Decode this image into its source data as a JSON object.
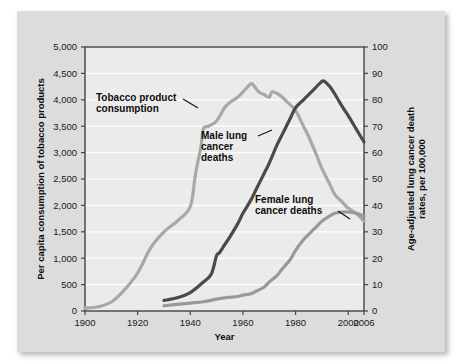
{
  "figure": {
    "background_color": "#dcdcdc",
    "plot_background_color": "#ebebeb",
    "gridline_color": "#ffffff",
    "axis_color": "#444444"
  },
  "chart_data": {
    "type": "line",
    "title": "",
    "xlabel": "Year",
    "ylabel": "Per capita consumption of tobacco products",
    "y2label_line1": "Age-adjusted lung cancer death",
    "y2label_line2": "rates, per 100,000",
    "grid": true,
    "legend_position": "inline-annotations",
    "xlim": [
      1900,
      2006
    ],
    "xticks": [
      1900,
      1920,
      1940,
      1960,
      1980,
      2000,
      2006
    ],
    "xtick_labels": [
      "1900",
      "1920",
      "1940",
      "1960",
      "1980",
      "2000",
      "2006"
    ],
    "ylim": [
      0,
      5000
    ],
    "yticks": [
      0,
      500,
      1000,
      1500,
      2000,
      2500,
      3000,
      3500,
      4000,
      4500,
      5000
    ],
    "ytick_labels": [
      "0",
      "500",
      "1,000",
      "1,500",
      "2,000",
      "2,500",
      "3,000",
      "3,500",
      "4,000",
      "4,500",
      "5,000"
    ],
    "y2lim": [
      0,
      100
    ],
    "y2ticks": [
      0,
      10,
      20,
      30,
      40,
      50,
      60,
      70,
      80,
      90,
      100
    ],
    "y2tick_labels": [
      "0",
      "10",
      "20",
      "30",
      "40",
      "50",
      "60",
      "70",
      "80",
      "90",
      "100"
    ],
    "series": [
      {
        "name": "Tobacco product consumption",
        "axis": "left",
        "color": "#a8a8a8",
        "line_width": 3.2,
        "x": [
          1900,
          1905,
          1910,
          1915,
          1920,
          1925,
          1930,
          1935,
          1940,
          1942,
          1944,
          1945,
          1947,
          1950,
          1953,
          1955,
          1958,
          1960,
          1963,
          1964,
          1966,
          1968,
          1970,
          1971,
          1973,
          1975,
          1977,
          1980,
          1983,
          1985,
          1988,
          1990,
          1993,
          1995,
          1998,
          2000,
          2003,
          2006
        ],
        "y": [
          55,
          80,
          170,
          400,
          720,
          1200,
          1500,
          1700,
          1980,
          2600,
          3100,
          3450,
          3500,
          3600,
          3850,
          3950,
          4050,
          4150,
          4300,
          4280,
          4150,
          4100,
          4050,
          4150,
          4120,
          4050,
          3950,
          3800,
          3500,
          3300,
          2950,
          2700,
          2400,
          2200,
          2050,
          1950,
          1850,
          1700
        ]
      },
      {
        "name": "Male lung cancer deaths",
        "axis": "right",
        "color": "#4a4a4a",
        "line_width": 3.2,
        "x": [
          1930,
          1935,
          1940,
          1945,
          1948,
          1950,
          1951,
          1953,
          1955,
          1958,
          1960,
          1963,
          1965,
          1968,
          1970,
          1973,
          1975,
          1978,
          1980,
          1983,
          1985,
          1988,
          1990,
          1991,
          1993,
          1995,
          1998,
          2000,
          2003,
          2006
        ],
        "y": [
          4,
          5,
          7,
          11,
          14,
          21,
          22,
          25,
          28,
          33,
          37,
          42,
          46,
          52,
          56,
          63,
          67,
          73,
          77,
          80,
          82,
          85,
          87,
          87,
          85,
          82,
          77,
          74,
          69,
          64
        ]
      },
      {
        "name": "Female lung cancer deaths",
        "axis": "right",
        "color": "#999999",
        "line_width": 3.2,
        "x": [
          1930,
          1935,
          1940,
          1945,
          1950,
          1953,
          1955,
          1958,
          1960,
          1963,
          1965,
          1968,
          1970,
          1973,
          1975,
          1978,
          1980,
          1983,
          1985,
          1988,
          1990,
          1993,
          1995,
          1998,
          2000,
          2003,
          2006
        ],
        "y": [
          2,
          2.5,
          3,
          3.5,
          4.5,
          5,
          5.2,
          5.5,
          6,
          6.5,
          7.5,
          9,
          11,
          13.5,
          16,
          19.5,
          23,
          27,
          29,
          32,
          34,
          36,
          37,
          37.5,
          37.5,
          37,
          36
        ]
      }
    ],
    "annotations": [
      {
        "id": "tobacco-annotation",
        "lines": [
          "Tobacco product",
          "consumption"
        ],
        "text_x": 96,
        "text_y": 101,
        "leader": {
          "x1": 183,
          "y1": 99,
          "x2": 198,
          "y2": 108
        }
      },
      {
        "id": "male-annotation",
        "lines": [
          "Male lung",
          "cancer",
          "deaths"
        ],
        "text_x": 201,
        "text_y": 139,
        "leader": {
          "x1": 258,
          "y1": 136,
          "x2": 272,
          "y2": 130
        }
      },
      {
        "id": "female-annotation",
        "lines": [
          "Female lung",
          "cancer deaths"
        ],
        "text_x": 255,
        "text_y": 203,
        "leader": {
          "x1": 338,
          "y1": 211,
          "x2": 350,
          "y2": 219
        }
      }
    ]
  }
}
